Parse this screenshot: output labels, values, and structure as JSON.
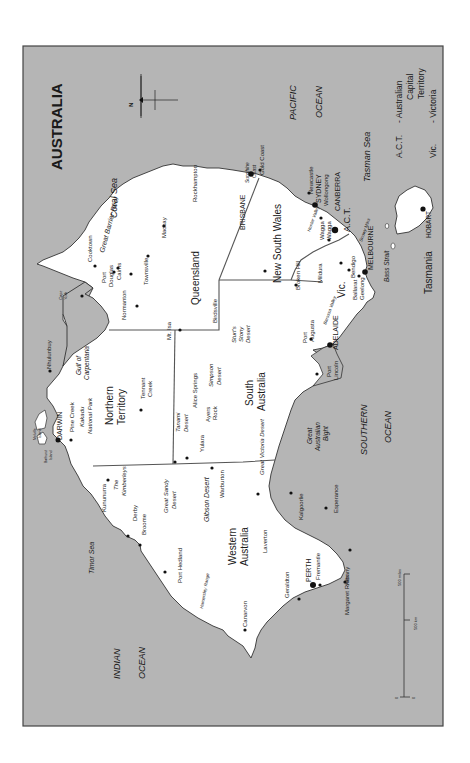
{
  "map": {
    "title": "AUSTRALIA",
    "orientation": "rotated-90-ccw (north points left)",
    "colors": {
      "sea": "#b5b5b5",
      "land": "#ffffff",
      "border": "#555555",
      "frame": "#444444",
      "text": "#1a1a1a"
    },
    "north_label": "N",
    "legend": {
      "act_abbr": "A.C.T.",
      "act_full_1": "- Australian",
      "act_full_2": "Capital",
      "act_full_3": "Territory",
      "vic_abbr": "Vic.",
      "vic_full": "- Victoria"
    },
    "scale": {
      "miles_label": "500 miles",
      "km_label": "500 km",
      "zero_left": "0",
      "zero_right": "0"
    },
    "seas": {
      "pacific_1": "PACIFIC",
      "pacific_2": "OCEAN",
      "indian_1": "INDIAN",
      "indian_2": "OCEAN",
      "southern_1": "SOUTHERN",
      "southern_2": "OCEAN",
      "coral_sea": "Coral Sea",
      "tasman_sea": "Tasman Sea",
      "timor_sea": "Timor Sea",
      "gulf_1": "Gulf of",
      "gulf_2": "Carpentaria",
      "bight_1": "Great",
      "bight_2": "Australian",
      "bight_3": "Bight",
      "bass_strait": "Bass Strait",
      "great_barrier_reef": "Great Barrier Reef"
    },
    "states": {
      "wa_1": "Western",
      "wa_2": "Australia",
      "nt_1": "Northern",
      "nt_2": "Territory",
      "qld": "Queensland",
      "sa_1": "South",
      "sa_2": "Australia",
      "nsw": "New South Wales",
      "vic": "Vic.",
      "act": "A.C.T.",
      "tas": "Tasmania"
    },
    "regions": {
      "cape_york_1": "Cape",
      "cape_york_2": "York",
      "kakadu_1": "Kakadu",
      "kakadu_2": "National Park",
      "kimberleys_1": "The",
      "kimberleys_2": "Kimberleys",
      "great_sandy_1": "Great Sandy",
      "great_sandy_2": "Desert",
      "gibson": "Gibson Desert",
      "great_victoria": "Great Victoria Desert",
      "tanami_1": "Tanami",
      "tanami_2": "Desert",
      "simpson_1": "Simpson",
      "simpson_2": "Desert",
      "sturt_1": "Sturt's",
      "sturt_2": "Stony",
      "sturt_3": "Desert",
      "hamersley": "Hamersley Range",
      "hunter_valley": "Hunter Valley",
      "barossa_valley": "Barossa Valley",
      "snowy_mtns": "Snowy Mtns",
      "sunshine_coast_1": "Sunshine",
      "sunshine_coast_2": "Coast",
      "melville_1": "Melville",
      "melville_2": "Island",
      "bathurst_1": "Bathurst",
      "bathurst_2": "Island"
    },
    "cities": [
      {
        "name": "DARWIN",
        "capital": true
      },
      {
        "name": "Pine Creek"
      },
      {
        "name": "Nhulunbuy"
      },
      {
        "name": "Tennant Creek"
      },
      {
        "name": "Alice Springs"
      },
      {
        "name": "Ayers Rock"
      },
      {
        "name": "Yulara"
      },
      {
        "name": "Kununurra"
      },
      {
        "name": "Derby"
      },
      {
        "name": "Broome"
      },
      {
        "name": "Port Hedland"
      },
      {
        "name": "Canarvon"
      },
      {
        "name": "Geraldton"
      },
      {
        "name": "PERTH",
        "capital": true
      },
      {
        "name": "Fremantle"
      },
      {
        "name": "Margaret River"
      },
      {
        "name": "Albany"
      },
      {
        "name": "Esperance"
      },
      {
        "name": "Kalgoorlie"
      },
      {
        "name": "Laverton"
      },
      {
        "name": "Warburton"
      },
      {
        "name": "Cooktown"
      },
      {
        "name": "Port Douglas"
      },
      {
        "name": "Cairns"
      },
      {
        "name": "Townsville"
      },
      {
        "name": "Mackay"
      },
      {
        "name": "Rockhampton"
      },
      {
        "name": "BRISBANE",
        "capital": true
      },
      {
        "name": "Gold Coast"
      },
      {
        "name": "Normanton"
      },
      {
        "name": "Mt. Isa"
      },
      {
        "name": "Birdsville"
      },
      {
        "name": "Newcastle"
      },
      {
        "name": "SYDNEY",
        "capital": true
      },
      {
        "name": "Wollongong"
      },
      {
        "name": "CANBERRA",
        "capital": true
      },
      {
        "name": "Wagga Wagga"
      },
      {
        "name": "Broken Hill"
      },
      {
        "name": "Mildura"
      },
      {
        "name": "Bendigo"
      },
      {
        "name": "Ballarat"
      },
      {
        "name": "Geelong"
      },
      {
        "name": "MELBOURNE",
        "capital": true
      },
      {
        "name": "ADELAIDE",
        "capital": true
      },
      {
        "name": "Port Augusta"
      },
      {
        "name": "Port Lincoln"
      },
      {
        "name": "HOBART",
        "capital": true
      }
    ],
    "city_labels": {
      "wagga_1": "Wagga",
      "wagga_2": "Wagga",
      "ayers_1": "Ayers",
      "ayers_2": "Rock",
      "tennant_1": "Tennant",
      "tennant_2": "Creek",
      "pdouglas_1": "Port",
      "pdouglas_2": "Douglas",
      "paugusta_1": "Port",
      "paugusta_2": "Augusta",
      "plincoln_1": "Port",
      "plincoln_2": "Lincoln"
    }
  }
}
